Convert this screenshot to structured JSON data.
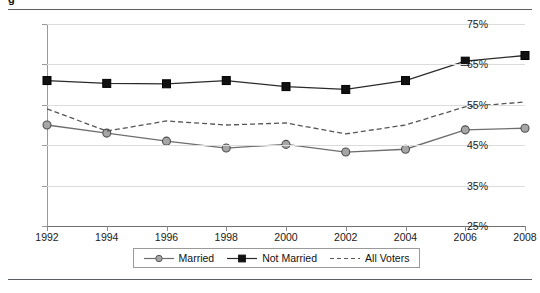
{
  "figure": {
    "title": "g",
    "title_note": "cropped",
    "rule_color": "#5a5f66"
  },
  "chart_data": {
    "type": "line",
    "title": "",
    "xlabel": "",
    "ylabel": "",
    "x": [
      1992,
      1994,
      1996,
      1998,
      2000,
      2002,
      2004,
      2006,
      2008
    ],
    "categories": [
      "1992",
      "1994",
      "1996",
      "1998",
      "2000",
      "2002",
      "2004",
      "2006",
      "2008"
    ],
    "ylim": [
      25,
      75
    ],
    "yticks": [
      25,
      35,
      45,
      55,
      65,
      75
    ],
    "ytick_labels": [
      "25%",
      "35%",
      "45%",
      "55%",
      "65%",
      "75%"
    ],
    "grid": true,
    "legend_position": "bottom-center",
    "series": [
      {
        "name": "Married",
        "marker": "circle",
        "line_style": "solid",
        "color": "#6e6e6e",
        "marker_fill": "#a6a6a6",
        "values": [
          50.0,
          48.0,
          46.0,
          44.3,
          45.2,
          43.3,
          44.0,
          48.8,
          49.2
        ]
      },
      {
        "name": "Not Married",
        "marker": "square",
        "line_style": "solid",
        "color": "#2b2b2b",
        "marker_fill": "#111111",
        "values": [
          61.0,
          60.3,
          60.2,
          61.0,
          59.5,
          58.8,
          61.0,
          65.8,
          67.2
        ]
      },
      {
        "name": "All Voters",
        "marker": "none",
        "line_style": "dashed",
        "color": "#555555",
        "marker_fill": "none",
        "values": [
          54.0,
          48.5,
          51.0,
          50.0,
          50.5,
          47.8,
          50.0,
          54.5,
          55.7
        ]
      }
    ]
  }
}
